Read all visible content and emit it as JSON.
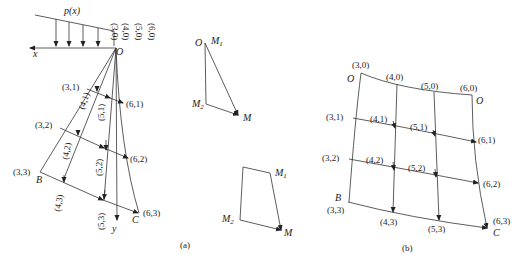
{
  "figure": {
    "panel_a": {
      "caption": "(a)",
      "load_label": "p(x)",
      "x_axis_label": "x",
      "y_axis_label": "y",
      "origin_label": "O",
      "point_B": "B",
      "point_C": "C",
      "top_nodes": [
        "(3,0)",
        "(4,0)",
        "(5,0)",
        "(6,0)"
      ],
      "nodes": {
        "n31": "(3,1)",
        "n41": "(4,1)",
        "n51": "(5,1)",
        "n61": "(6,1)",
        "n32": "(3,2)",
        "n42": "(4,2)",
        "n52": "(5,2)",
        "n62": "(6,2)",
        "n33": "(3,3)",
        "n43": "(4,3)",
        "n53": "(5,3)",
        "n63": "(6,3)"
      },
      "triangle": {
        "O": "O",
        "M1": "M",
        "M1_sub": "1",
        "M2": "M",
        "M2_sub": "2",
        "M": "M"
      },
      "quad": {
        "M1": "M",
        "M1_sub": "1",
        "M2": "M",
        "M2_sub": "2",
        "M": "M"
      }
    },
    "panel_b": {
      "caption": "(b)",
      "O_left": "O",
      "O_right": "O",
      "point_B": "B",
      "point_C": "C",
      "nodes": {
        "n30": "(3,0)",
        "n40": "(4,0)",
        "n50": "(5,0)",
        "n60": "(6,0)",
        "n31": "(3,1)",
        "n41": "(4,1)",
        "n51": "(5,1)",
        "n61": "(6,1)",
        "n32": "(3,2)",
        "n42": "(4,2)",
        "n52": "(5,2)",
        "n62": "(6,2)",
        "n33": "(3,3)",
        "n43": "(4,3)",
        "n53": "(5,3)",
        "n63": "(6,3)"
      }
    }
  }
}
